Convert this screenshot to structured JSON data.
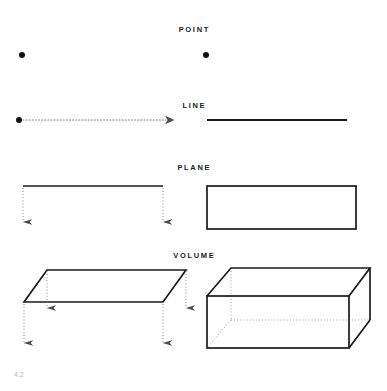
{
  "page": {
    "folio": "4.2",
    "background_color": "#ffffff",
    "ink_color": "#1a1a1a",
    "dotted_color": "#8a8a8a",
    "folio_color": "#b5b5b5"
  },
  "rows": [
    {
      "key": "point",
      "label": "POINT",
      "left_figure": "single-dot-generator",
      "right_figure": "single-dot-result"
    },
    {
      "key": "line",
      "label": "LINE",
      "left_figure": "dot-with-dotted-arrow",
      "right_figure": "solid-horizontal-line"
    },
    {
      "key": "plane",
      "label": "PLANE",
      "left_figure": "line-swept-down-two-arrows",
      "right_figure": "rectangle-outline"
    },
    {
      "key": "volume",
      "label": "VOLUME",
      "left_figure": "parallelogram-swept-down-four-arrows",
      "right_figure": "rectangular-box-wireframe"
    }
  ],
  "geometry": {
    "point": {
      "left_dot": {
        "cx": 22,
        "cy": 55,
        "r": 3
      },
      "right_dot": {
        "cx": 206,
        "cy": 55,
        "r": 3
      }
    },
    "line": {
      "origin_dot": {
        "cx": 19,
        "cy": 120,
        "r": 3
      },
      "dotted_arrow": {
        "x1": 22,
        "y1": 120,
        "x2": 166,
        "y2": 120
      },
      "solid_line": {
        "x1": 207,
        "y1": 120,
        "x2": 347,
        "y2": 120
      }
    },
    "plane": {
      "source_line": {
        "x1": 23,
        "y1": 186,
        "x2": 163,
        "y2": 186
      },
      "arrows": [
        {
          "x": 23,
          "y1": 188,
          "y2": 226
        },
        {
          "x": 163,
          "y1": 188,
          "y2": 226
        }
      ],
      "rectangle": {
        "x": 207,
        "y": 186,
        "w": 149,
        "h": 43
      }
    },
    "volume": {
      "plane_top": [
        {
          "x": 47,
          "y": 270
        },
        {
          "x": 186,
          "y": 270
        },
        {
          "x": 163,
          "y": 302
        },
        {
          "x": 24,
          "y": 302
        }
      ],
      "arrows": [
        {
          "x": 48,
          "y1": 272,
          "y2": 312
        },
        {
          "x": 186,
          "y1": 272,
          "y2": 312
        },
        {
          "x": 24,
          "y1": 305,
          "y2": 347
        },
        {
          "x": 163,
          "y1": 305,
          "y2": 347
        }
      ],
      "box": {
        "front_face": {
          "x": 207,
          "y": 296,
          "w": 142,
          "h": 52
        },
        "top_back_left": {
          "x": 231,
          "y": 268
        },
        "top_back_right": {
          "x": 370,
          "y": 268
        },
        "hidden_back_bottom": {
          "x": 231,
          "y": 320
        }
      }
    }
  }
}
